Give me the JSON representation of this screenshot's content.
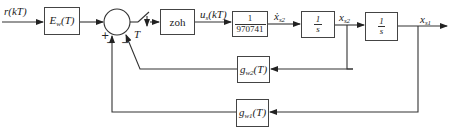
{
  "diagram": {
    "type": "block-diagram",
    "input_label": "r(kT)",
    "output_label": "x_s1",
    "blocks": [
      {
        "id": "Ew",
        "label": "E",
        "sub": "w",
        "suffix": "(T)"
      },
      {
        "id": "zoh",
        "label": "zoh"
      },
      {
        "id": "gain",
        "num": "1",
        "den": "970741"
      },
      {
        "id": "int2",
        "num": "1",
        "den": "s"
      },
      {
        "id": "int1",
        "num": "1",
        "den": "s"
      },
      {
        "id": "gw2",
        "label": "g",
        "sub": "w2",
        "suffix": "(T)"
      },
      {
        "id": "gw1",
        "label": "g",
        "sub": "w1",
        "suffix": "(T)"
      }
    ],
    "signals": {
      "r": "r(kT)",
      "us_main": "u",
      "us_sub": "s",
      "us_suffix": "(kT)",
      "xdot_main": "ẋ",
      "xdot_sub": "s2",
      "xs2_main": "x",
      "xs2_sub": "s2",
      "xs1_main": "x",
      "xs1_sub": "s1"
    },
    "summing_junction": {
      "signs": [
        "+",
        "−",
        "−"
      ]
    },
    "sampler": {
      "label": "T"
    },
    "edges": [
      "r(kT) -> Ew",
      "Ew -> sum(+)",
      "sum -> sampler(T) -> zoh",
      "zoh -> u_s(kT) -> 1/970741",
      "1/970741 -> xdot_s2 -> 1/s",
      "1/s -> x_s2 -> 1/s",
      "1/s -> x_s1 (output)",
      "x_s2 -> g_w2(T) -> sum(−)",
      "x_s1 -> g_w1(T) -> sum(−)"
    ]
  }
}
